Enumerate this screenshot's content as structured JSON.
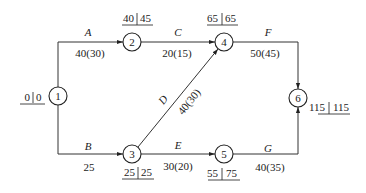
{
  "diagram": {
    "type": "activity-on-arrow network (CPM)",
    "nodes": [
      {
        "id": "1",
        "label": "1",
        "es": "0",
        "ls": "0"
      },
      {
        "id": "2",
        "label": "2",
        "es": "40",
        "ls": "45"
      },
      {
        "id": "3",
        "label": "3",
        "es": "25",
        "ls": "25"
      },
      {
        "id": "4",
        "label": "4",
        "es": "65",
        "ls": "65"
      },
      {
        "id": "5",
        "label": "5",
        "es": "55",
        "ls": "75"
      },
      {
        "id": "6",
        "label": "6",
        "es": "115",
        "ls": "115"
      }
    ],
    "edges": [
      {
        "name": "A",
        "from": "1",
        "to": "2",
        "duration": "40(30)"
      },
      {
        "name": "B",
        "from": "1",
        "to": "3",
        "duration": "25"
      },
      {
        "name": "C",
        "from": "2",
        "to": "4",
        "duration": "20(15)"
      },
      {
        "name": "D",
        "from": "3",
        "to": "4",
        "duration": "40(30)"
      },
      {
        "name": "E",
        "from": "3",
        "to": "5",
        "duration": "30(20)"
      },
      {
        "name": "F",
        "from": "4",
        "to": "6",
        "duration": "50(45)"
      },
      {
        "name": "G",
        "from": "5",
        "to": "6",
        "duration": "40(35)"
      }
    ]
  }
}
